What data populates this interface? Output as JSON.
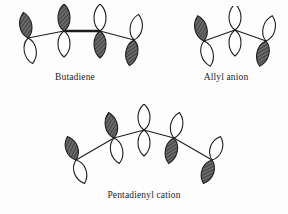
{
  "figure": {
    "background_color": "#fdfdfd",
    "ink_color": "#1d1d1d",
    "shaded_lobe_color": "#5a5a5a",
    "unshaded_lobe_color": "#ffffff"
  },
  "diagrams": [
    {
      "id": "butadiene",
      "caption": "Butadiene",
      "orbital_count": 4,
      "arrangement": "zigzag",
      "orbitals": [
        {
          "index": 1,
          "shaded_lobe": "top",
          "tilt_deg": -10
        },
        {
          "index": 2,
          "shaded_lobe": "top",
          "tilt_deg": 0
        },
        {
          "index": 3,
          "shaded_lobe": "bottom",
          "tilt_deg": 0
        },
        {
          "index": 4,
          "shaded_lobe": "bottom",
          "tilt_deg": 10
        }
      ]
    },
    {
      "id": "allyl-anion",
      "caption": "Allyl anion",
      "orbital_count": 3,
      "arrangement": "inverted-v",
      "orbitals": [
        {
          "index": 1,
          "shaded_lobe": "top",
          "tilt_deg": -14
        },
        {
          "index": 2,
          "shaded_lobe": "none",
          "tilt_deg": 0
        },
        {
          "index": 3,
          "shaded_lobe": "bottom",
          "tilt_deg": 14
        }
      ]
    },
    {
      "id": "pentadienyl-cation",
      "caption": "Pentadienyl cation",
      "orbital_count": 5,
      "arrangement": "arc",
      "orbitals": [
        {
          "index": 1,
          "shaded_lobe": "top",
          "tilt_deg": -20
        },
        {
          "index": 2,
          "shaded_lobe": "top",
          "tilt_deg": -12
        },
        {
          "index": 3,
          "shaded_lobe": "none",
          "tilt_deg": 0
        },
        {
          "index": 4,
          "shaded_lobe": "bottom",
          "tilt_deg": 12
        },
        {
          "index": 5,
          "shaded_lobe": "bottom",
          "tilt_deg": 20
        }
      ]
    }
  ]
}
